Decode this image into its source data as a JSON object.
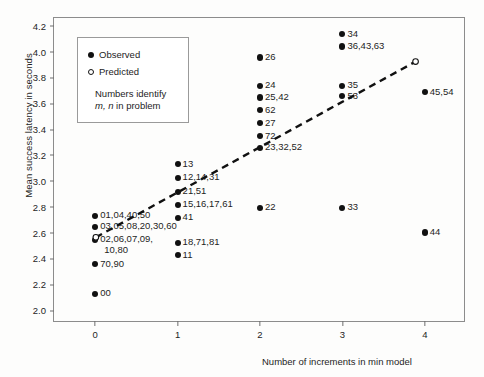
{
  "chart_data": {
    "type": "scatter",
    "title": "",
    "xlabel": "Number of increments in min model",
    "ylabel": "Mean success latency in seconds",
    "xlim": [
      -0.5,
      4.5
    ],
    "ylim": [
      1.9,
      4.26
    ],
    "xticks": [
      "0",
      "1",
      "2",
      "3",
      "4"
    ],
    "yticks": [
      "4.2",
      "4.0",
      "3.8",
      "3.6",
      "3.4",
      "3.2",
      "3.0",
      "2.8",
      "2.6",
      "2.4",
      "2.2",
      "2.0"
    ],
    "grid": false,
    "legend": {
      "position": "upper-left-inset",
      "entries": [
        {
          "marker": "filled-circle",
          "label": "Observed"
        },
        {
          "marker": "open-circle",
          "label": "Predicted"
        }
      ],
      "note_line1": "Numbers identify",
      "note_line2_italic": "m, n",
      "note_line2_rest": " in problem"
    },
    "series": [
      {
        "name": "Observed",
        "marker": "filled-circle",
        "points": [
          {
            "x": 0,
            "y": 2.73,
            "label": "01,04,40,50"
          },
          {
            "x": 0,
            "y": 2.645,
            "label": "03,05,08,20,30,60"
          },
          {
            "x": 0,
            "y": 2.545,
            "label": "02,06,07,09,"
          },
          {
            "x": 0,
            "y": 2.545,
            "label2": "10,80"
          },
          {
            "x": 0,
            "y": 2.355,
            "label": "70,90"
          },
          {
            "x": 0,
            "y": 2.125,
            "label": "00"
          },
          {
            "x": 1,
            "y": 3.13,
            "label": "13"
          },
          {
            "x": 1,
            "y": 3.025,
            "label": "12,14,31"
          },
          {
            "x": 1,
            "y": 2.915,
            "label": "21,51"
          },
          {
            "x": 1,
            "y": 2.815,
            "label": "15,16,17,61"
          },
          {
            "x": 1,
            "y": 2.715,
            "label": "41"
          },
          {
            "x": 1,
            "y": 2.52,
            "label": "18,71,81"
          },
          {
            "x": 1,
            "y": 2.425,
            "label": "11"
          },
          {
            "x": 2,
            "y": 3.955,
            "label": "26"
          },
          {
            "x": 2,
            "y": 3.735,
            "label": "24"
          },
          {
            "x": 2,
            "y": 3.645,
            "label": "25,42"
          },
          {
            "x": 2,
            "y": 3.545,
            "label": "62"
          },
          {
            "x": 2,
            "y": 3.445,
            "label": "27"
          },
          {
            "x": 2,
            "y": 3.345,
            "label": "72"
          },
          {
            "x": 2,
            "y": 3.255,
            "label": "23,32,52"
          },
          {
            "x": 2,
            "y": 2.79,
            "label": "22"
          },
          {
            "x": 3,
            "y": 4.135,
            "label": "34"
          },
          {
            "x": 3,
            "y": 4.04,
            "label": "36,43,63"
          },
          {
            "x": 3,
            "y": 3.735,
            "label": "35"
          },
          {
            "x": 3,
            "y": 3.655,
            "label": "53"
          },
          {
            "x": 3,
            "y": 2.79,
            "label": "33"
          },
          {
            "x": 4,
            "y": 3.685,
            "label": "45,54"
          },
          {
            "x": 4,
            "y": 2.6,
            "label": "44"
          }
        ]
      },
      {
        "name": "Predicted",
        "marker": "open-circle",
        "style": "dashed-line",
        "points": [
          {
            "x": 0.02,
            "y": 2.555
          },
          {
            "x": 3.9,
            "y": 3.915
          }
        ]
      }
    ]
  }
}
